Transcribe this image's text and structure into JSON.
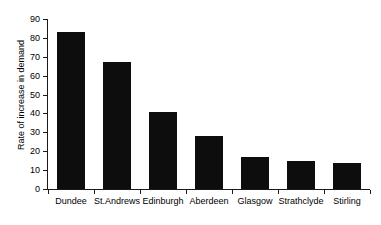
{
  "chart_data": {
    "type": "bar",
    "title": "",
    "xlabel": "",
    "ylabel": "Rate of increase in demand",
    "categories": [
      "Dundee",
      "St.Andrews",
      "Edinburgh",
      "Aberdeen",
      "Glasgow",
      "Strathclyde",
      "Stirling"
    ],
    "values": [
      83,
      67,
      41,
      28,
      17,
      15,
      14
    ],
    "ylim": [
      0,
      90
    ],
    "ytick_step": 10,
    "ytick_labels": [
      "0",
      "10",
      "20",
      "30",
      "40",
      "50",
      "60",
      "70",
      "80",
      "90"
    ],
    "grid": false,
    "legend": null,
    "bar_color": "#0d0d0d",
    "background_color": "#ffffff",
    "axis_color": "#1a1a1a"
  }
}
